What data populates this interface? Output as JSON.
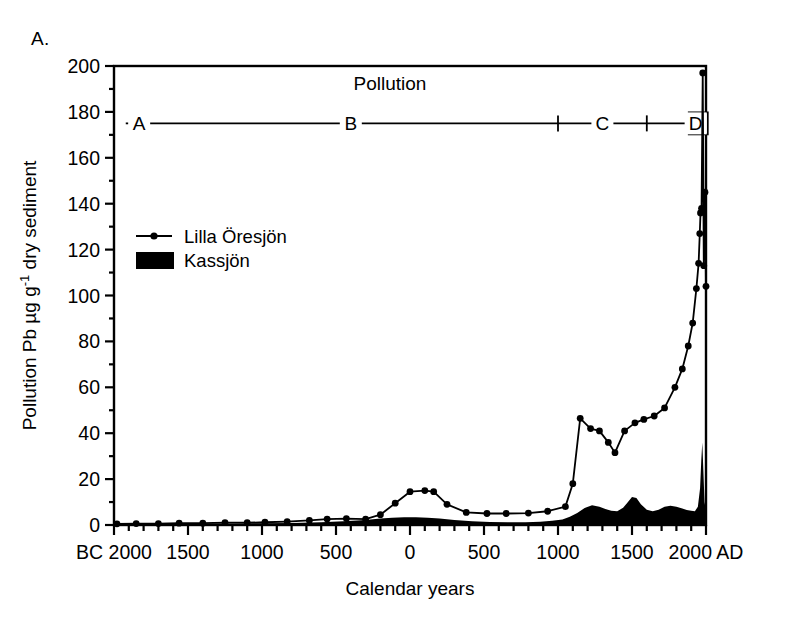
{
  "figure": {
    "panel_label": "A.",
    "plot_title": "Pollution",
    "background": "#ffffff",
    "ink": "#000000"
  },
  "axes": {
    "x_label": "Calendar years",
    "x_ticks": [
      "BC 2000",
      "1500",
      "1000",
      "500",
      "0",
      "500",
      "1000",
      "1500",
      "2000 AD"
    ],
    "x_tick_values": [
      -2000,
      -1500,
      -1000,
      -500,
      0,
      500,
      1000,
      1500,
      2000
    ],
    "x_minor_step": 100,
    "x_range": [
      -2000,
      2000
    ],
    "y_label": "Pollution Pb µg g",
    "y_label_sup": "-1",
    "y_label_tail": " dry sediment",
    "y_ticks": [
      "0",
      "20",
      "40",
      "60",
      "80",
      "100",
      "120",
      "140",
      "160",
      "180",
      "200"
    ],
    "y_tick_values": [
      0,
      20,
      40,
      60,
      80,
      100,
      120,
      140,
      160,
      180,
      200
    ],
    "y_minor_step": 10,
    "y_range": [
      0,
      200
    ]
  },
  "zone_bar": {
    "level": 175,
    "labels": [
      "A",
      "B",
      "C",
      "D"
    ],
    "boundaries": [
      -1880,
      -1780,
      1000,
      1600,
      1870,
      1960
    ],
    "label_positions": [
      -1830,
      -400,
      1300,
      1930
    ]
  },
  "legend": {
    "items": [
      {
        "label": "Lilla Öresjön",
        "marker": "line-with-dot",
        "color": "#000000"
      },
      {
        "label": "Kassjön",
        "marker": "filled-box",
        "color": "#000000"
      }
    ]
  },
  "chart_data": {
    "type": "line",
    "title": "Pollution",
    "xlabel": "Calendar years",
    "ylabel": "Pollution Pb µg g-1 dry sediment",
    "xlim": [
      -2000,
      2000
    ],
    "ylim": [
      0,
      200
    ],
    "grid": false,
    "legend_position": "upper-left-inside",
    "series": [
      {
        "name": "Lilla Öresjön",
        "type": "line-markers",
        "x": [
          -1980,
          -1850,
          -1700,
          -1560,
          -1400,
          -1250,
          -1100,
          -980,
          -830,
          -680,
          -560,
          -430,
          -300,
          -200,
          -100,
          0,
          100,
          160,
          250,
          380,
          520,
          650,
          800,
          930,
          1050,
          1100,
          1150,
          1220,
          1280,
          1340,
          1385,
          1450,
          1520,
          1580,
          1650,
          1720,
          1790,
          1840,
          1880,
          1910,
          1935,
          1950,
          1958,
          1963,
          1970,
          1978,
          1985,
          1993,
          2000
        ],
        "y": [
          0.5,
          0.6,
          0.6,
          0.8,
          0.8,
          1.0,
          1.0,
          1.2,
          1.5,
          2.0,
          2.6,
          2.8,
          2.6,
          4.5,
          9.5,
          14.5,
          15.0,
          14.5,
          9.0,
          5.5,
          5.0,
          5.0,
          5.2,
          6.0,
          8.0,
          18.0,
          46.5,
          42.0,
          41.0,
          36.0,
          31.5,
          41.0,
          44.5,
          46.0,
          47.5,
          51.0,
          60.0,
          68.0,
          78.0,
          88.0,
          103.0,
          114.0,
          127.0,
          136.0,
          138.0,
          197.0,
          113.0,
          145.0,
          104.0
        ]
      },
      {
        "name": "Kassjön",
        "type": "filled-area",
        "x": [
          -2000,
          -1800,
          -1600,
          -1400,
          -1200,
          -1000,
          -800,
          -600,
          -450,
          -300,
          -200,
          -120,
          -40,
          40,
          120,
          200,
          300,
          420,
          540,
          660,
          780,
          880,
          960,
          1030,
          1080,
          1130,
          1180,
          1230,
          1280,
          1320,
          1360,
          1400,
          1440,
          1470,
          1500,
          1530,
          1560,
          1600,
          1640,
          1680,
          1720,
          1760,
          1800,
          1840,
          1870,
          1900,
          1925,
          1945,
          1960,
          1968,
          1975,
          1982,
          1990,
          2000
        ],
        "y": [
          0.4,
          0.5,
          0.6,
          0.6,
          0.7,
          0.8,
          0.9,
          1.2,
          1.6,
          2.2,
          2.8,
          3.2,
          3.4,
          3.4,
          3.2,
          2.8,
          2.2,
          1.6,
          1.3,
          1.2,
          1.2,
          1.4,
          1.8,
          2.4,
          3.6,
          5.2,
          7.4,
          8.6,
          8.0,
          7.0,
          6.2,
          6.0,
          7.5,
          9.8,
          12.2,
          11.8,
          9.0,
          6.6,
          6.0,
          6.6,
          8.0,
          8.4,
          8.0,
          7.2,
          6.5,
          6.2,
          6.0,
          8.0,
          16.0,
          28.0,
          36.0,
          24.0,
          10.0,
          6.0
        ]
      }
    ],
    "annotations": [
      {
        "text": "Pollution",
        "x": 0,
        "y": 190
      },
      {
        "text": "A",
        "x": -1830,
        "y": 175
      },
      {
        "text": "B",
        "x": -400,
        "y": 175
      },
      {
        "text": "C",
        "x": 1300,
        "y": 175
      },
      {
        "text": "D",
        "x": 1930,
        "y": 175
      }
    ]
  }
}
